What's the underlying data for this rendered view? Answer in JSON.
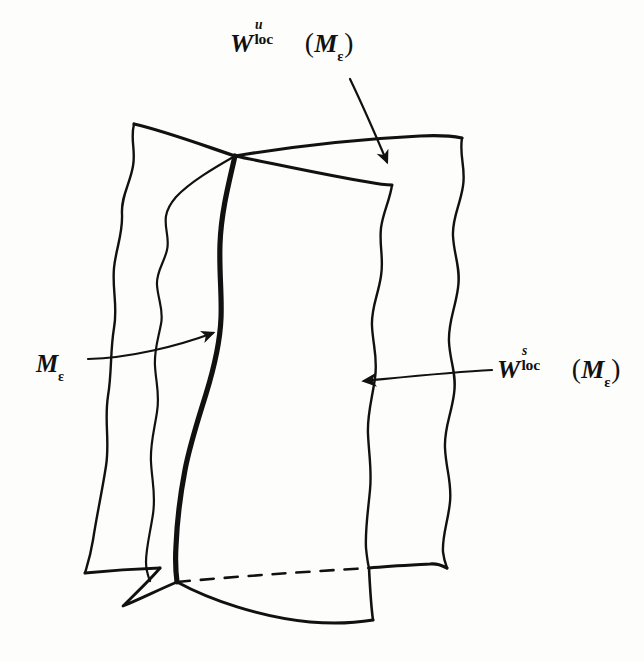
{
  "figure": {
    "kind": "hand-drawn-diagram",
    "caption_absent": true,
    "background_color": "#fdfdfb",
    "ink_color": "#111111",
    "width": 644,
    "height": 661
  },
  "labels": {
    "unstable": {
      "name": "W-u-loc-of-M-epsilon",
      "w": "W",
      "superscript": "u",
      "subscript": "loc",
      "open_paren": "(",
      "manifold": "M",
      "manifold_subscript": "ε",
      "close_paren": ")",
      "plain_text": "Wᵘₗₒₑ(Mε)"
    },
    "stable": {
      "name": "W-s-loc-of-M-epsilon",
      "w": "W",
      "superscript": "s",
      "subscript": "loc",
      "open_paren": "(",
      "manifold": "M",
      "manifold_subscript": "ε",
      "close_paren": ")",
      "plain_text": "Wˢₗₒₑ(Mε)"
    },
    "manifold": {
      "name": "M-epsilon",
      "manifold": "M",
      "manifold_subscript": "ε",
      "plain_text": "Mε"
    }
  },
  "annotations": {
    "arrow_unstable": {
      "from_x": 350,
      "from_y": 79,
      "to_x": 388,
      "to_y": 165,
      "points_to": "unstable-surface-top-edge"
    },
    "arrow_stable": {
      "from_x": 492,
      "from_y": 370,
      "to_x": 359,
      "to_y": 381,
      "points_to": "stable-surface-interior"
    },
    "arrow_manifold": {
      "from_x": 88,
      "from_y": 358,
      "to_x": 216,
      "to_y": 331,
      "points_to": "thick-intersection-curve"
    }
  },
  "geometry": {
    "thick_curve_label": "M-epsilon intersection curve",
    "dashed_edge_label": "hidden bottom edge of stable surface",
    "crossing_point": {
      "x": 235,
      "y": 155
    },
    "bottom_crossing_point": {
      "x": 177,
      "y": 582
    },
    "stroke_width_thin": 2.2,
    "stroke_width_thick": 5.0
  }
}
